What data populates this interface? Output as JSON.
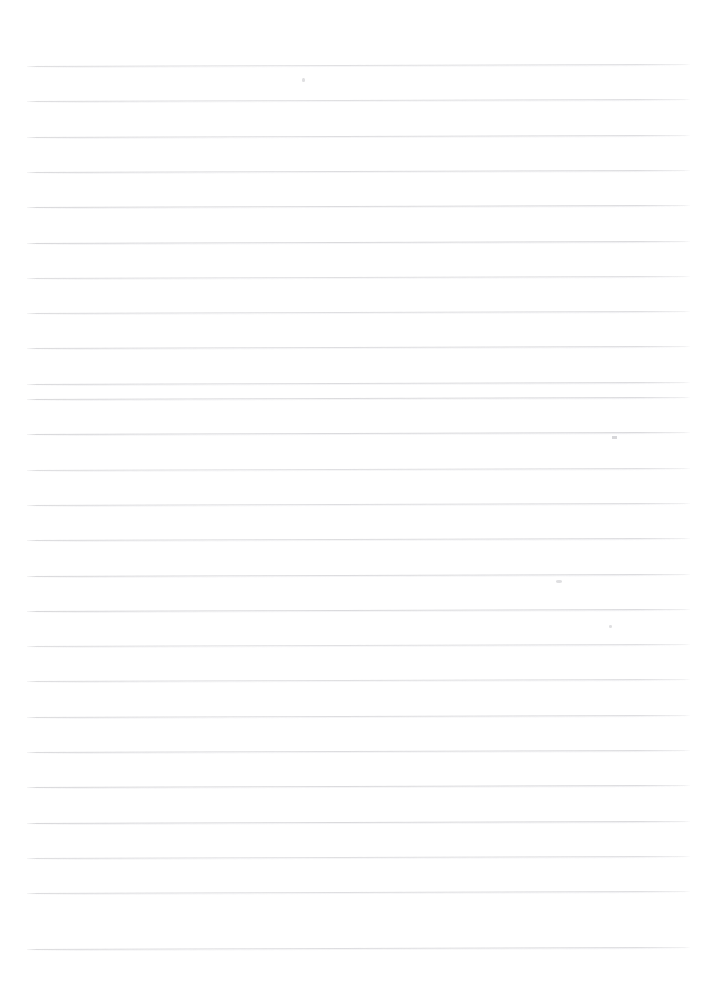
{
  "document": {
    "type": "scanned-blank-ruled-paper",
    "title": "Blank lined notebook page",
    "page_width": 716,
    "page_height": 1007,
    "background_color": "#ffffff",
    "has_text": false,
    "has_handwriting": false,
    "has_header": false,
    "has_margin_rule": false,
    "content_note": ""
  },
  "ruling": {
    "line_color": "#d4d4d7",
    "line_count": 26,
    "line_thickness_px": 1,
    "spacing_px": 35.3,
    "first_line_y": 66,
    "last_line_y": 949,
    "left_edge_x": 27,
    "right_edge_x": 690,
    "line_length_px": 663,
    "skew_degrees": -0.18,
    "lines_y": [
      66,
      101.3,
      136.6,
      171.9,
      207.2,
      242.5,
      277.8,
      313.1,
      348.4,
      383.7,
      399.0,
      434.3,
      469.6,
      504.9,
      540.2,
      575.5,
      610.8,
      646.1,
      681.4,
      716.7,
      752.0,
      787.3,
      822.6,
      857.9,
      893.2,
      948.5
    ]
  },
  "margins": {
    "top_px": 66,
    "bottom_px": 58,
    "left_px": 27,
    "right_px": 26
  },
  "artifacts": {
    "label": "scanner specks",
    "items": [
      {
        "name": "speck-upper-center",
        "x": 302,
        "y": 78,
        "w": 3,
        "h": 4
      },
      {
        "name": "tick-mid-right",
        "x": 612,
        "y": 436,
        "w": 5,
        "h": 3
      },
      {
        "name": "speck-right-lower",
        "x": 556,
        "y": 580,
        "w": 6,
        "h": 3
      },
      {
        "name": "speck-right-faint",
        "x": 609,
        "y": 625,
        "w": 3,
        "h": 3
      }
    ]
  }
}
